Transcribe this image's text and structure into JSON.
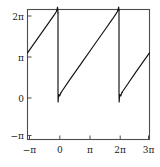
{
  "chart_data": {
    "type": "line",
    "title": "",
    "subtitle": "",
    "xlabel": "",
    "ylabel": "",
    "xlim": [
      -3.14159265,
      9.42477796
    ],
    "ylim": [
      -3.14159265,
      6.28318531
    ],
    "grid": false,
    "legend": null,
    "xticks": [
      -3.14159265,
      0,
      3.14159265,
      6.28318531,
      9.42477796
    ],
    "xticklabels": [
      "−π",
      "0",
      "π",
      "2π",
      "3π"
    ],
    "yticks": [
      -3.14159265,
      0,
      3.14159265,
      6.28318531
    ],
    "yticklabels": [
      "−π",
      "0",
      "π",
      "2π"
    ],
    "series": [
      {
        "name": "sawtooth",
        "color": "#111111",
        "linewidth": 1.15,
        "segments": [
          {
            "comment": "rising ramp from (-pi, pi) up to (0, 2pi) with Gibbs overshoot near x=0",
            "points": [
              [
                -3.14159265,
                3.14159265
              ],
              [
                -2.0,
                4.28
              ],
              [
                -1.0,
                5.28
              ],
              [
                -0.35,
                5.93
              ],
              [
                -0.18,
                6.12
              ],
              [
                -0.09,
                6.3
              ],
              [
                -0.05,
                6.45
              ],
              [
                -0.02,
                6.3
              ],
              [
                0.0,
                6.05
              ]
            ]
          },
          {
            "comment": "vertical drop at x=0 from 2pi down through 0 with undershoot",
            "points": [
              [
                0.0,
                6.05
              ],
              [
                0.0,
                0.25
              ],
              [
                0.01,
                -0.42
              ],
              [
                0.04,
                -0.1
              ],
              [
                0.09,
                0.12
              ],
              [
                0.18,
                0.02
              ],
              [
                0.3,
                0.25
              ]
            ]
          },
          {
            "comment": "rising ramp from (0, 0) up to (2pi, 2pi) with Gibbs overshoot near x=2pi",
            "points": [
              [
                0.3,
                0.25
              ],
              [
                1.2,
                1.18
              ],
              [
                2.4,
                2.38
              ],
              [
                3.6,
                3.58
              ],
              [
                4.8,
                4.78
              ],
              [
                5.6,
                5.58
              ],
              [
                5.95,
                5.95
              ],
              [
                6.12,
                6.14
              ],
              [
                6.2,
                6.32
              ],
              [
                6.25,
                6.46
              ],
              [
                6.28,
                6.22
              ]
            ]
          },
          {
            "comment": "vertical drop at x=2pi from 2pi down through 0 with undershoot",
            "points": [
              [
                6.28318531,
                6.22
              ],
              [
                6.28318531,
                0.25
              ],
              [
                6.3,
                -0.42
              ],
              [
                6.33,
                -0.1
              ],
              [
                6.38,
                0.12
              ],
              [
                6.47,
                0.02
              ],
              [
                6.6,
                0.28
              ]
            ]
          },
          {
            "comment": "final rising ramp from (2pi, 0) to (3pi, pi) at right frame edge",
            "points": [
              [
                6.6,
                0.28
              ],
              [
                7.2,
                0.9
              ],
              [
                8.0,
                1.72
              ],
              [
                8.8,
                2.52
              ],
              [
                9.42477796,
                3.14159265
              ]
            ]
          }
        ]
      }
    ]
  },
  "axes": {
    "frame_color": "#4d4d4d",
    "background": "#ffffff",
    "tick_direction": "in"
  }
}
